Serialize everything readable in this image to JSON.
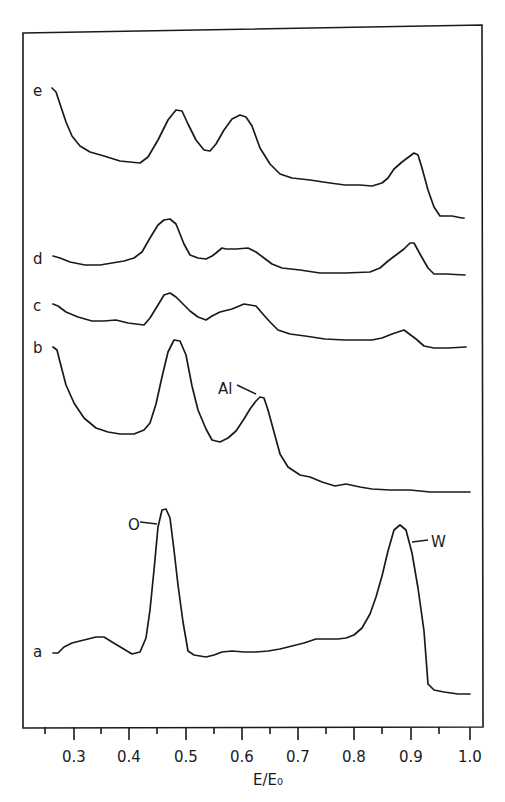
{
  "chart_data": {
    "type": "line",
    "title": "",
    "xlabel": "E/E₀",
    "ylabel": "",
    "xlim": [
      0.25,
      1.02
    ],
    "xticks": [
      0.3,
      0.4,
      0.5,
      0.6,
      0.7,
      0.8,
      0.9,
      1.0
    ],
    "xtick_labels": [
      "0.3",
      "0.4",
      "0.5",
      "0.6",
      "0.7",
      "0.8",
      "0.9",
      "1.0"
    ],
    "grid": false,
    "legend": "none (curves labelled a–e at left)",
    "series": [
      {
        "name": "e",
        "label": "e",
        "x": [
          0.27,
          0.28,
          0.3,
          0.33,
          0.37,
          0.42,
          0.45,
          0.48,
          0.49,
          0.51,
          0.54,
          0.57,
          0.6,
          0.62,
          0.65,
          0.7,
          0.75,
          0.8,
          0.84,
          0.86,
          0.89,
          0.9,
          0.92,
          0.95,
          0.99
        ],
        "y": [
          9.0,
          8.5,
          6.0,
          4.2,
          3.3,
          3.0,
          4.5,
          7.4,
          7.6,
          6.4,
          5.0,
          6.2,
          7.2,
          6.4,
          3.6,
          2.8,
          2.5,
          2.4,
          2.8,
          4.0,
          4.6,
          3.7,
          0.6,
          0.6,
          0.5
        ]
      },
      {
        "name": "d",
        "label": "d",
        "x": [
          0.27,
          0.3,
          0.35,
          0.42,
          0.45,
          0.47,
          0.48,
          0.5,
          0.52,
          0.55,
          0.57,
          0.6,
          0.62,
          0.66,
          0.7,
          0.75,
          0.8,
          0.85,
          0.88,
          0.89,
          0.91,
          0.93,
          0.99
        ],
        "y": [
          1.3,
          1.0,
          0.8,
          1.0,
          2.4,
          3.3,
          3.2,
          1.5,
          1.0,
          1.3,
          1.8,
          1.8,
          1.5,
          0.9,
          0.6,
          0.5,
          0.5,
          1.2,
          2.6,
          2.7,
          1.5,
          0.2,
          0.2
        ]
      },
      {
        "name": "c",
        "label": "c",
        "x": [
          0.27,
          0.3,
          0.35,
          0.4,
          0.42,
          0.45,
          0.47,
          0.49,
          0.51,
          0.54,
          0.57,
          0.6,
          0.62,
          0.64,
          0.66,
          0.7,
          0.75,
          0.8,
          0.85,
          0.88,
          0.9,
          0.92,
          0.99
        ],
        "y": [
          2.4,
          1.7,
          1.1,
          1.0,
          0.9,
          2.5,
          3.3,
          2.7,
          1.8,
          0.9,
          1.3,
          1.8,
          2.0,
          1.7,
          1.0,
          0.7,
          0.5,
          0.3,
          0.5,
          0.9,
          0.5,
          0.0,
          0.0
        ]
      },
      {
        "name": "b",
        "label": "b",
        "x": [
          0.27,
          0.28,
          0.3,
          0.33,
          0.36,
          0.4,
          0.43,
          0.45,
          0.47,
          0.49,
          0.5,
          0.51,
          0.53,
          0.55,
          0.57,
          0.6,
          0.62,
          0.64,
          0.66,
          0.68,
          0.7,
          0.75,
          0.8,
          0.85,
          0.9,
          0.95,
          1.0
        ],
        "y": [
          10.5,
          10.2,
          6.5,
          4.0,
          3.0,
          2.7,
          2.9,
          5.0,
          9.5,
          13.0,
          12.5,
          9.0,
          4.5,
          3.2,
          3.5,
          5.8,
          8.2,
          8.4,
          6.0,
          2.8,
          2.0,
          1.4,
          1.0,
          0.6,
          0.3,
          0.2,
          0.1
        ]
      },
      {
        "name": "a",
        "label": "a",
        "x": [
          0.27,
          0.28,
          0.3,
          0.33,
          0.35,
          0.38,
          0.42,
          0.43,
          0.44,
          0.45,
          0.46,
          0.47,
          0.48,
          0.49,
          0.5,
          0.52,
          0.55,
          0.6,
          0.65,
          0.7,
          0.73,
          0.78,
          0.8,
          0.83,
          0.85,
          0.87,
          0.88,
          0.89,
          0.9,
          0.91,
          0.92,
          0.94,
          0.99
        ],
        "y": [
          1.4,
          1.4,
          2.2,
          2.6,
          2.8,
          2.3,
          1.6,
          3.5,
          10.0,
          16.0,
          19.5,
          19.0,
          13.0,
          5.0,
          1.0,
          0.8,
          1.2,
          1.0,
          1.4,
          1.9,
          2.5,
          2.4,
          3.1,
          6.0,
          10.5,
          15.0,
          16.5,
          16.0,
          12.5,
          6.0,
          0.0,
          -0.4,
          -0.5
        ]
      }
    ],
    "annotations": [
      {
        "text": "O",
        "series": "a",
        "x": 0.46,
        "note": "oxygen peak"
      },
      {
        "text": "W",
        "series": "a",
        "x": 0.88,
        "note": "tungsten peak"
      },
      {
        "text": "Al",
        "series": "b",
        "x": 0.64,
        "note": "aluminium peak"
      }
    ]
  },
  "axis": {
    "xlabel": "E/E₀",
    "ticks": [
      {
        "label": "0.3",
        "px": 74
      },
      {
        "label": "0.4",
        "px": 129
      },
      {
        "label": "0.5",
        "px": 186
      },
      {
        "label": "0.6",
        "px": 242
      },
      {
        "label": "0.7",
        "px": 298
      },
      {
        "label": "0.8",
        "px": 354
      },
      {
        "label": "0.9",
        "px": 411
      },
      {
        "label": "1.0",
        "px": 470
      }
    ],
    "minor_ticks_px": [
      45,
      101,
      157,
      214,
      270,
      326,
      382,
      439
    ]
  },
  "curves": [
    {
      "label": "e",
      "label_pos": [
        33,
        96
      ],
      "points": "52,88 56,92 60,104 66,122 72,136 80,146 90,152 104,156 120,161 140,163 148,157 158,140 168,120 176,110 182,111 188,124 196,140 204,150 210,151 216,144 224,130 232,119 240,115 246,117 252,126 260,148 270,164 280,174 292,178 310,180 330,183 345,185 360,185 372,186 382,183 388,178 394,169 402,162 410,156 414,153 418,155 422,168 428,190 434,207 440,216 452,216 462,218 464,218"
    },
    {
      "label": "d",
      "label_pos": [
        33,
        264
      ],
      "points": "53,256 60,258 70,262 85,265 100,265 112,263 124,261 134,258 142,252 150,238 158,225 164,220 170,219 176,224 184,244 190,255 198,258 206,259 212,256 216,253 222,248 226,249 236,249 248,248 256,252 264,258 272,264 282,268 300,270 320,273 345,273 370,272 380,268 388,261 396,255 404,249 410,243 414,243 420,254 428,268 434,274 446,274 465,275"
    },
    {
      "label": "c",
      "label_pos": [
        33,
        311
      ],
      "points": "53,304 58,306 66,312 78,317 92,321 104,321 116,320 128,323 144,325 150,318 158,305 164,295 170,293 176,297 182,303 190,311 198,317 206,320 212,316 220,312 232,309 244,304 256,306 262,313 270,322 278,330 290,334 305,336 325,339 345,340 372,340 382,338 392,334 404,330 408,333 416,339 424,346 434,348 448,348 466,347"
    },
    {
      "label": "b",
      "label_pos": [
        33,
        353
      ],
      "points": "53,347 57,350 60,362 66,385 74,403 84,418 96,428 108,432 120,434 134,434 144,430 150,423 156,404 162,377 168,352 174,340 180,341 186,355 192,386 198,410 206,429 212,440 220,442 228,438 236,431 244,419 250,409 256,401 260,397 264,398 268,410 274,432 280,454 288,467 300,475 310,477 322,482 335,486 346,484 360,487 372,489 390,490 410,490 430,492 450,492 470,492"
    },
    {
      "label": "a",
      "label_pos": [
        33,
        657
      ],
      "points": "53,653 58,653 64,647 72,643 84,640 96,637 104,637 112,642 122,648 132,654 140,652 146,638 150,610 154,570 158,527 162,510 166,509 170,518 174,550 178,585 183,622 188,651 194,655 206,657 214,655 222,652 232,651 244,652 256,652 268,651 280,649 292,646 304,643 316,639 328,639 338,639 346,638 354,635 362,628 370,614 376,597 382,576 388,551 394,530 400,525 406,530 412,553 418,588 424,631 428,684 434,690 444,692 458,694 470,694"
    }
  ],
  "annotations": [
    {
      "text": "O",
      "text_pos": [
        128,
        530
      ],
      "leader": [
        140,
        522,
        157,
        524
      ]
    },
    {
      "text": "W",
      "text_pos": [
        431,
        547
      ],
      "leader": [
        412,
        542,
        428,
        540
      ]
    },
    {
      "text": "Al",
      "text_pos": [
        218,
        394
      ],
      "leader": [
        237,
        385,
        256,
        394
      ]
    }
  ]
}
